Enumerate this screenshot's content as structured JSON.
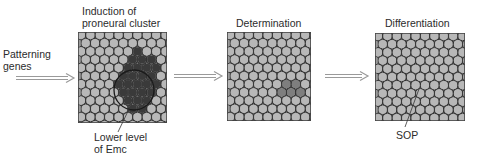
{
  "diagram": {
    "input": {
      "label_line1": "Patterning",
      "label_line2": "genes"
    },
    "panels": [
      {
        "title_line1": "Induction of",
        "title_line2": "proneural cluster",
        "annotation_line1": "Lower level",
        "annotation_line2": "of Emc",
        "stage": "induction"
      },
      {
        "title_line1": "Determination",
        "stage": "determination"
      },
      {
        "title_line1": "Differentiation",
        "annotation_line1": "SOP",
        "stage": "differentiation"
      }
    ],
    "colors": {
      "cell_fill": "#b8b8b8",
      "cell_outline": "#333333",
      "grid_bg": "#9a9a9a",
      "proneural_dark": "#3a3a3a",
      "medium_gray": "#7e7e7e",
      "sop": "#2e2e2e",
      "arrow": "#9a9a9a"
    }
  }
}
